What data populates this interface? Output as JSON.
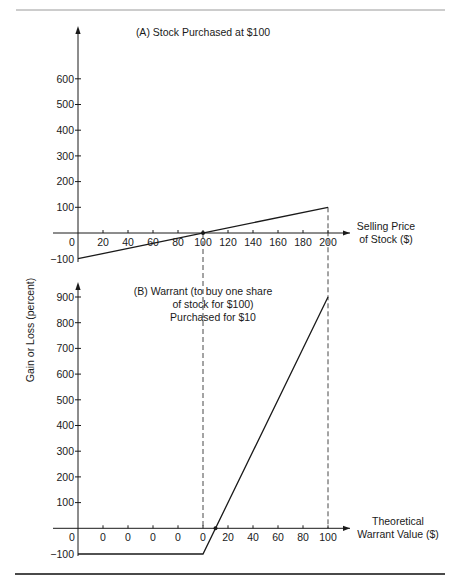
{
  "shared_ylabel": "Gain or Loss (percent)",
  "chart_data": [
    {
      "type": "line",
      "title": "(A) Stock Purchased at $100",
      "xlabel_lines": [
        "Selling Price",
        "of Stock ($)"
      ],
      "ylabel": "Gain or Loss (percent)",
      "x_ticks": [
        0,
        20,
        40,
        60,
        80,
        100,
        120,
        140,
        160,
        180,
        200
      ],
      "x_tick_labels": [
        "0",
        "20",
        "40",
        "60",
        "80",
        "100",
        "120",
        "140",
        "160",
        "180",
        "200"
      ],
      "y_ticks": [
        -100,
        100,
        200,
        300,
        400,
        500,
        600
      ],
      "y_tick_labels": [
        "−100",
        "100",
        "200",
        "300",
        "400",
        "500",
        "600"
      ],
      "xlim": [
        0,
        200
      ],
      "ylim": [
        -100,
        600
      ],
      "grid": false,
      "series": [
        {
          "name": "Stock gain/loss",
          "x": [
            0,
            200
          ],
          "y": [
            -100,
            100
          ]
        }
      ],
      "markers": [
        {
          "x": 100,
          "y": 0
        }
      ],
      "reference_lines": [
        {
          "x": 100,
          "style": "dashed"
        },
        {
          "x": 200,
          "style": "dashed"
        }
      ]
    },
    {
      "type": "line",
      "title_lines": [
        "(B) Warrant (to buy one share",
        "of stock for $100)",
        "Purchased for $10"
      ],
      "xlabel_lines": [
        "Theoretical",
        "Warrant Value ($)"
      ],
      "ylabel": "Gain or Loss (percent)",
      "x_ticks": [
        0,
        0,
        0,
        0,
        0,
        0,
        20,
        40,
        60,
        80,
        100
      ],
      "x_tick_labels": [
        "0",
        "0",
        "0",
        "0",
        "0",
        "0",
        "20",
        "40",
        "60",
        "80",
        "100"
      ],
      "y_ticks": [
        -100,
        100,
        200,
        300,
        400,
        500,
        600,
        700,
        800,
        900
      ],
      "y_tick_labels": [
        "−100",
        "100",
        "200",
        "300",
        "400",
        "500",
        "600",
        "700",
        "800",
        "900"
      ],
      "xlim": [
        0,
        100
      ],
      "ylim": [
        -100,
        900
      ],
      "grid": false,
      "series": [
        {
          "name": "Warrant gain/loss",
          "x": [
            "stock 0",
            0,
            100
          ],
          "y": [
            -100,
            -100,
            900
          ]
        }
      ],
      "markers": [
        {
          "x": 10,
          "y": 0
        }
      ]
    }
  ]
}
